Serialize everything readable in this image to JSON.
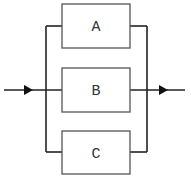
{
  "diagram": {
    "type": "parallel-block-diagram",
    "blocks": [
      {
        "id": "A",
        "label": "A"
      },
      {
        "id": "B",
        "label": "B"
      },
      {
        "id": "C",
        "label": "C"
      }
    ],
    "input": {
      "direction": "right"
    },
    "output": {
      "direction": "right"
    },
    "colors": {
      "stroke": "#222222",
      "box_stroke": "#555555",
      "background": "#ffffff"
    }
  }
}
